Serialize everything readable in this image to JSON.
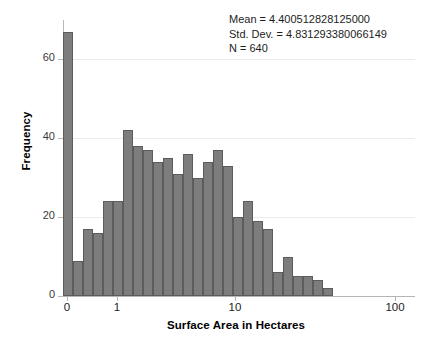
{
  "chart_data": {
    "type": "bar",
    "title": "",
    "xlabel": "Surface Area in Hectares",
    "ylabel": "Frequency",
    "xscale": "log",
    "grid": true,
    "legend": null,
    "ylim": [
      0,
      70
    ],
    "yticks": [
      0,
      20,
      40,
      60
    ],
    "ytick_labels": [
      "0",
      "20",
      "40",
      "60"
    ],
    "xticks": [
      0,
      1,
      10,
      100
    ],
    "xtick_labels": [
      "0",
      "1",
      "10",
      "100"
    ],
    "bin_centers_px": [
      68,
      78,
      88,
      98,
      108,
      118,
      128,
      138,
      148,
      158,
      168,
      178,
      188,
      198,
      208,
      218,
      228,
      238,
      248,
      258,
      268,
      278,
      288,
      298,
      308,
      318,
      328
    ],
    "values": [
      67,
      9,
      17,
      16,
      24,
      24,
      42,
      38,
      37,
      34,
      35,
      31,
      36,
      30,
      34,
      37,
      33,
      20,
      24,
      19,
      17,
      6,
      10,
      5,
      5,
      4,
      2
    ],
    "bar_color": "#7d7d7d",
    "bar_edge_color": "#5c5c5c",
    "annotations": {
      "mean_label": "Mean = 4.400512828125000",
      "stddev_label": "Std. Dev. = 4.831293380066149",
      "n_label": "N = 640"
    }
  },
  "axes": {
    "y_title": "Frequency",
    "x_title": "Surface Area in Hectares"
  },
  "colors": {
    "background": "#ffffff",
    "grid": "#ececec",
    "axis": "#b5b5b5",
    "text": "#1d1d1d"
  }
}
